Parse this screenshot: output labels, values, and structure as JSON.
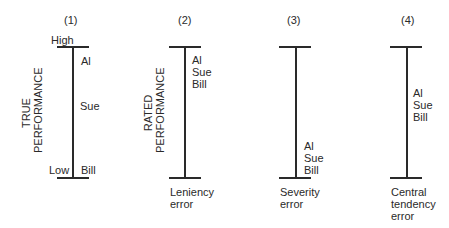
{
  "diagram": {
    "panels": [
      {
        "number": "(1)",
        "axis_label": [
          "TRUE",
          "PERFORMANCE"
        ],
        "top_label": "High",
        "bottom_label": "Low",
        "ratees": [
          {
            "name": "Al",
            "position": "high"
          },
          {
            "name": "Sue",
            "position": "middle"
          },
          {
            "name": "Bill",
            "position": "low"
          }
        ],
        "caption": []
      },
      {
        "number": "(2)",
        "axis_label": [
          "RATED",
          "PERFORMANCE"
        ],
        "ratees_stack": [
          "Al",
          "Sue",
          "Bill"
        ],
        "stack_position": "top",
        "caption": [
          "Leniency",
          "error"
        ]
      },
      {
        "number": "(3)",
        "ratees_stack": [
          "Al",
          "Sue",
          "Bill"
        ],
        "stack_position": "bottom",
        "caption": [
          "Severity",
          "error"
        ]
      },
      {
        "number": "(4)",
        "ratees_stack": [
          "Al",
          "Sue",
          "Bill"
        ],
        "stack_position": "middle",
        "caption": [
          "Central",
          "tendency",
          "error"
        ]
      }
    ],
    "line_color": "#2a2a2a"
  }
}
